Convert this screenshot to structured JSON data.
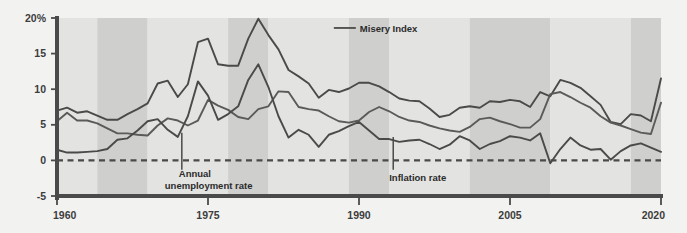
{
  "chart_data": {
    "type": "line",
    "title": "",
    "xlabel": "",
    "ylabel": "",
    "xlim": [
      1960,
      2020
    ],
    "ylim": [
      -5,
      20
    ],
    "grid": false,
    "legend_position": "inline-annotations",
    "x_ticks": [
      "1960",
      "1975",
      "1990",
      "2005",
      "2020"
    ],
    "x_tick_values": [
      1960,
      1975,
      1990,
      2005,
      2020
    ],
    "y_ticks": [
      "20%",
      "15",
      "10",
      "5",
      "0",
      "-5"
    ],
    "y_tick_values": [
      20,
      15,
      10,
      5,
      0,
      -5
    ],
    "zero_line": 0,
    "x": [
      1960,
      1961,
      1962,
      1963,
      1964,
      1965,
      1966,
      1967,
      1968,
      1969,
      1970,
      1971,
      1972,
      1973,
      1974,
      1975,
      1976,
      1977,
      1978,
      1979,
      1980,
      1981,
      1982,
      1983,
      1984,
      1985,
      1986,
      1987,
      1988,
      1989,
      1990,
      1991,
      1992,
      1993,
      1994,
      1995,
      1996,
      1997,
      1998,
      1999,
      2000,
      2001,
      2002,
      2003,
      2004,
      2005,
      2006,
      2007,
      2008,
      2009,
      2010,
      2011,
      2012,
      2013,
      2014,
      2015,
      2016,
      2017,
      2018,
      2019,
      2020
    ],
    "series": [
      {
        "name": "Misery Index",
        "color": "#4a4a4a",
        "values": [
          7.0,
          7.4,
          6.7,
          6.9,
          6.3,
          5.7,
          5.7,
          6.5,
          7.2,
          8.0,
          10.8,
          11.2,
          8.9,
          10.7,
          16.6,
          17.1,
          13.5,
          13.3,
          13.3,
          17.1,
          19.9,
          17.6,
          15.6,
          12.7,
          11.8,
          10.8,
          8.8,
          9.9,
          9.6,
          10.1,
          10.9,
          10.9,
          10.4,
          9.6,
          8.7,
          8.4,
          8.3,
          7.3,
          6.1,
          6.4,
          7.4,
          7.6,
          7.4,
          8.3,
          8.2,
          8.5,
          8.3,
          7.5,
          9.6,
          9.0,
          11.3,
          10.9,
          10.2,
          9.0,
          7.8,
          5.4,
          5.1,
          6.5,
          6.3,
          5.5,
          11.5
        ]
      },
      {
        "name": "Annual unemployment rate",
        "color": "#5a5a5a",
        "values": [
          5.5,
          6.7,
          5.6,
          5.6,
          5.2,
          4.5,
          3.8,
          3.8,
          3.6,
          3.5,
          4.9,
          5.9,
          5.6,
          4.9,
          5.6,
          8.5,
          7.7,
          7.1,
          6.1,
          5.8,
          7.2,
          7.6,
          9.7,
          9.6,
          7.5,
          7.2,
          7.0,
          6.2,
          5.5,
          5.3,
          5.6,
          6.8,
          7.5,
          6.9,
          6.1,
          5.6,
          5.4,
          4.9,
          4.5,
          4.2,
          4.0,
          4.7,
          5.8,
          6.0,
          5.5,
          5.1,
          4.6,
          4.6,
          5.8,
          9.3,
          9.6,
          8.9,
          8.1,
          7.4,
          6.2,
          5.3,
          4.9,
          4.4,
          3.9,
          3.7,
          8.1
        ]
      },
      {
        "name": "Inflation rate",
        "color": "#4a4a4a",
        "values": [
          1.5,
          1.1,
          1.1,
          1.2,
          1.3,
          1.6,
          2.9,
          3.1,
          4.2,
          5.5,
          5.8,
          4.3,
          3.3,
          6.2,
          11.1,
          9.1,
          5.7,
          6.5,
          7.6,
          11.3,
          13.5,
          10.3,
          6.2,
          3.2,
          4.3,
          3.6,
          1.9,
          3.6,
          4.1,
          4.8,
          5.4,
          4.2,
          3.0,
          3.0,
          2.6,
          2.8,
          2.9,
          2.3,
          1.6,
          2.2,
          3.4,
          2.8,
          1.6,
          2.3,
          2.7,
          3.4,
          3.2,
          2.8,
          3.8,
          -0.4,
          1.6,
          3.2,
          2.1,
          1.5,
          1.6,
          0.1,
          1.3,
          2.1,
          2.4,
          1.8,
          1.2
        ]
      }
    ],
    "bands": [
      {
        "start": 1960,
        "end": 1964,
        "shade": "light"
      },
      {
        "start": 1964,
        "end": 1969,
        "shade": "dark"
      },
      {
        "start": 1969,
        "end": 1977,
        "shade": "light"
      },
      {
        "start": 1977,
        "end": 1981,
        "shade": "dark"
      },
      {
        "start": 1981,
        "end": 1989,
        "shade": "light"
      },
      {
        "start": 1989,
        "end": 1993,
        "shade": "dark"
      },
      {
        "start": 1993,
        "end": 2001,
        "shade": "light"
      },
      {
        "start": 2001,
        "end": 2009,
        "shade": "dark"
      },
      {
        "start": 2009,
        "end": 2017,
        "shade": "light"
      },
      {
        "start": 2017,
        "end": 2020,
        "shade": "dark"
      }
    ],
    "annotations": [
      {
        "id": "misery-index",
        "text": "Misery Index",
        "x": 1987.5,
        "y": 18.6,
        "leader": "horizontal"
      },
      {
        "id": "annual-unemployment-rate",
        "text": "Annual\nunemployment rate",
        "line1": "Annual",
        "line2": "unemployment rate",
        "x": 1972.4,
        "y": -1.6,
        "leader": "vertical"
      },
      {
        "id": "inflation-rate",
        "text": "Inflation rate",
        "x": 1993.4,
        "y": -2.0,
        "leader": "vertical"
      }
    ]
  },
  "colors": {
    "background": "#f2f2f0",
    "band_light": "#e3e3e1",
    "band_dark": "#cfcfcd",
    "axis": "#4a4a4a",
    "line": "#4a4a4a",
    "text": "#2b2b2b"
  }
}
